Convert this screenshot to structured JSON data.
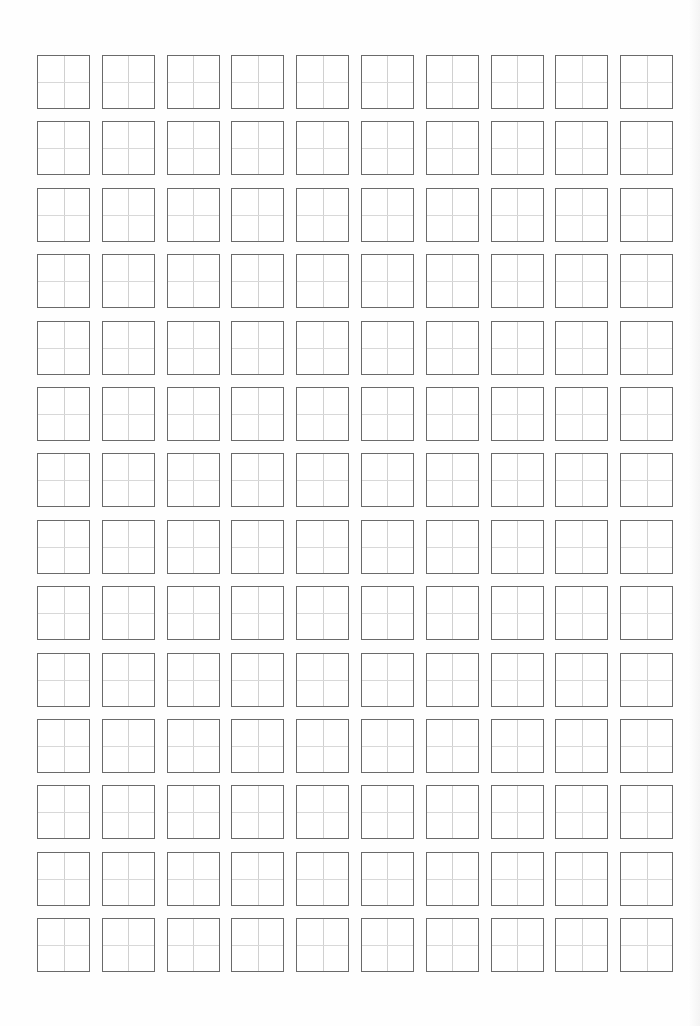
{
  "sheet": {
    "type": "tianzige-practice-grid",
    "columns": 10,
    "rows": 14,
    "cell_count": 140,
    "colors": {
      "background": "#ffffff",
      "cell_border": "#6a6a6a",
      "guide_lines": "#d0d0d0"
    },
    "cells_text": []
  }
}
